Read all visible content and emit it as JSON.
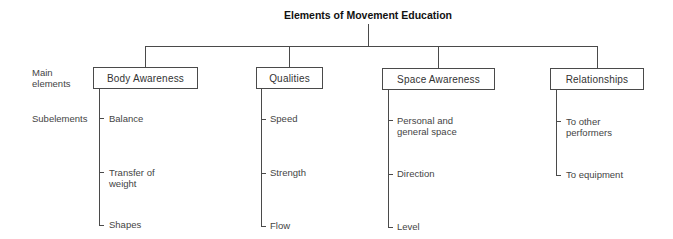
{
  "title": "Elements of Movement Education",
  "row_labels": {
    "main_line1": "Main",
    "main_line2": "elements",
    "sub": "Subelements"
  },
  "main_elements": [
    {
      "label": "Body Awareness",
      "subelements": [
        {
          "line1": "Balance",
          "line2": ""
        },
        {
          "line1": "Transfer of",
          "line2": "weight"
        },
        {
          "line1": "Shapes",
          "line2": ""
        }
      ]
    },
    {
      "label": "Qualities",
      "subelements": [
        {
          "line1": "Speed",
          "line2": ""
        },
        {
          "line1": "Strength",
          "line2": ""
        },
        {
          "line1": "Flow",
          "line2": ""
        }
      ]
    },
    {
      "label": "Space Awareness",
      "subelements": [
        {
          "line1": "Personal and",
          "line2": "general space"
        },
        {
          "line1": "Direction",
          "line2": ""
        },
        {
          "line1": "Level",
          "line2": ""
        }
      ]
    },
    {
      "label": "Relationships",
      "subelements": [
        {
          "line1": "To other",
          "line2": "performers"
        },
        {
          "line1": "To equipment",
          "line2": ""
        }
      ]
    }
  ]
}
